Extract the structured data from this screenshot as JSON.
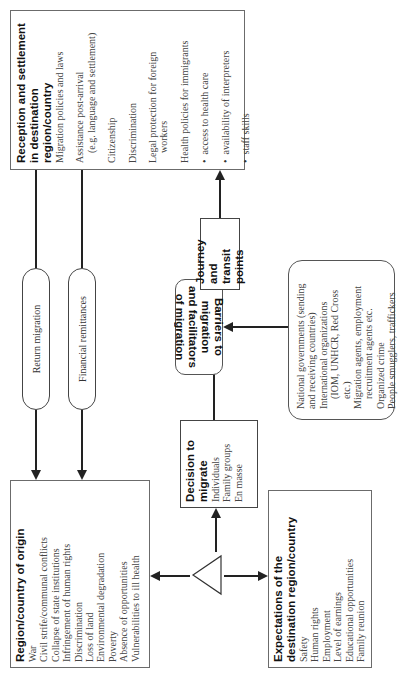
{
  "origin": {
    "title": "Region/country of origin",
    "items": [
      "War",
      "Civil strife/communal conflicts",
      "Collapse of state institutions",
      "Infringement of human rights",
      "Discrimination",
      "Loss of land",
      "Environmental degradation",
      "Poverty",
      "Absence of opportunities",
      "Vulnerabilities to ill health"
    ]
  },
  "decision": {
    "title": "Decision to migrate",
    "items": [
      "Individuals",
      "Family groups",
      "En masse"
    ]
  },
  "expectations": {
    "title_line1": "Expectations of the",
    "title_line2": "destination region/country",
    "items": [
      "Safety",
      "Human rights",
      "Employment",
      "Level of earnings",
      "Educational opportunities",
      "Family reunion"
    ]
  },
  "barriers": {
    "line1": "Barriers to migration",
    "line2": "and facilitators of migration"
  },
  "actors": {
    "items": [
      "National governments (sending",
      "and receiving countries)",
      "International organizations",
      "(IOM, UNHCR, Red Cross etc.)",
      "Migration agents, employment",
      "recruitment agents etc.",
      "Organized crime",
      "People smugglers, traffickers"
    ]
  },
  "journey": {
    "line1": "Journey and",
    "line2": "transit points"
  },
  "reception": {
    "title_line1": "Reception and settlement",
    "title_line2": "in destination",
    "title_line3": "region/country",
    "items": {
      "policies": "Migration policies and laws",
      "assistance1": "Assistance post-arrival",
      "assistance2": "(e.g. language and settlement)",
      "citizenship": "Citizenship",
      "discrimination": "Discrimination",
      "legal1": "Legal protection for foreign",
      "legal2": "workers",
      "health": "Health policies for immigrants",
      "bullets": [
        "access to health care",
        "availability of interpreters",
        "staff skills"
      ]
    }
  },
  "flows": {
    "return_migration": "Return migration",
    "financial_remittances": "Financial remittances"
  }
}
